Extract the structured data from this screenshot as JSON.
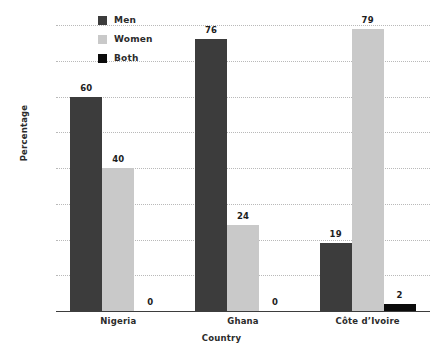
{
  "chart_data": {
    "type": "bar",
    "title": "",
    "subtitle": "",
    "xlabel": "Country",
    "ylabel": "Percentage",
    "categories": [
      "Nigeria",
      "Ghana",
      "Côte d’Ivoire"
    ],
    "series": [
      {
        "name": "Men",
        "color": "#3c3c3c",
        "values": [
          60,
          76,
          19
        ]
      },
      {
        "name": "Women",
        "color": "#c9c9c9",
        "values": [
          40,
          24,
          79
        ]
      },
      {
        "name": "Both",
        "color": "#0b0b0b",
        "values": [
          0,
          0,
          2
        ]
      }
    ],
    "ylim": [
      0,
      80
    ],
    "y_ticks": [
      0,
      10,
      20,
      30,
      40,
      50,
      60,
      70,
      80
    ],
    "y_tick_labels": [
      "0%",
      "10%",
      "20%",
      "30%",
      "40%",
      "50%",
      "60%",
      "70%",
      "80%"
    ],
    "grid": true,
    "grid_style": "dotted",
    "legend_position": "top-left-inside",
    "data_labels": [
      [
        "60",
        "40",
        "0"
      ],
      [
        "76",
        "24",
        "0"
      ],
      [
        "19",
        "79",
        "2"
      ]
    ],
    "bar_grouping": "adjacent-no-gap",
    "background_color": "#ffffff",
    "axis_color": "#3d3d3d",
    "gridline_color": "#b9b9b9",
    "text_color": "#2b2b2b"
  }
}
